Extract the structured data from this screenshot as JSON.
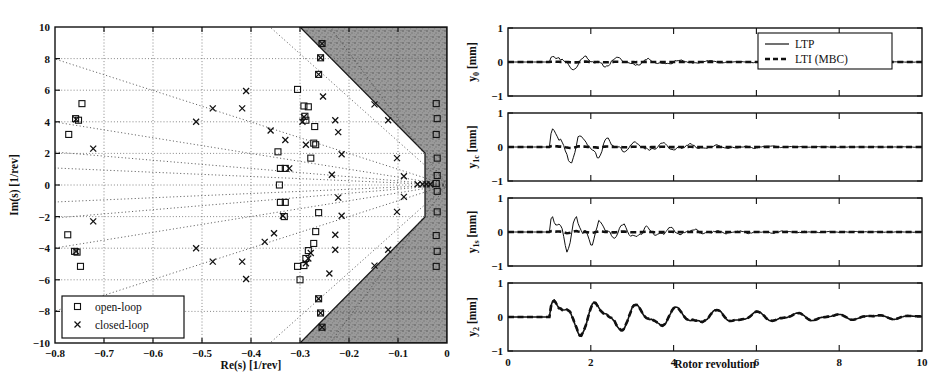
{
  "figure": {
    "caption_line1": "Figure 2: Pole map ... and closed-loop ...",
    "caption_visible": ""
  },
  "left_plot": {
    "name": "pole-map",
    "xlabel": "Re(s) [1/rev]",
    "ylabel": "Im(s) [1/rev]",
    "xticks": [
      "-0.8",
      "-0.7",
      "-0.6",
      "-0.5",
      "-0.4",
      "-0.3",
      "-0.2",
      "-0.1",
      "0"
    ],
    "xtick_values": [
      -0.8,
      -0.7,
      -0.6,
      -0.5,
      -0.4,
      -0.3,
      -0.2,
      -0.1,
      0
    ],
    "yticks": [
      "10",
      "8",
      "6",
      "4",
      "2",
      "0",
      "-2",
      "-4",
      "-6",
      "-8",
      "-10"
    ],
    "ytick_values": [
      10,
      8,
      6,
      4,
      2,
      0,
      -2,
      -4,
      -6,
      -8,
      -10
    ],
    "xlim": [
      -0.8,
      0
    ],
    "ylim": [
      -10,
      10
    ],
    "grid": true,
    "legend": [
      {
        "label": "open-loop",
        "marker": "square"
      },
      {
        "label": "closed-loop",
        "marker": "cross"
      }
    ],
    "shaded_region_label": "insufficient-damping-region",
    "shaded_color": "#8f8f8f"
  },
  "chart_data": [
    {
      "type": "scatter",
      "title": "Pole map",
      "xlabel": "Re(s) [1/rev]",
      "ylabel": "Im(s) [1/rev]",
      "xlim": [
        -0.8,
        0
      ],
      "ylim": [
        -10,
        10
      ],
      "grid": true,
      "legend_position": "lower-left",
      "series": [
        {
          "name": "open-loop",
          "marker": "square",
          "points": [
            [
              -0.745,
              5.15
            ],
            [
              -0.758,
              4.2
            ],
            [
              -0.752,
              4.1
            ],
            [
              -0.772,
              3.2
            ],
            [
              -0.774,
              -3.15
            ],
            [
              -0.76,
              -4.2
            ],
            [
              -0.755,
              -4.25
            ],
            [
              -0.748,
              -5.15
            ],
            [
              -0.345,
              2.1
            ],
            [
              -0.34,
              1.05
            ],
            [
              -0.33,
              1.05
            ],
            [
              -0.342,
              0.0
            ],
            [
              -0.34,
              -1.1
            ],
            [
              -0.33,
              -1.1
            ],
            [
              -0.332,
              -2.0
            ],
            [
              -0.305,
              6.05
            ],
            [
              -0.292,
              5.0
            ],
            [
              -0.283,
              4.95
            ],
            [
              -0.29,
              4.35
            ],
            [
              -0.288,
              4.1
            ],
            [
              -0.27,
              3.7
            ],
            [
              -0.272,
              2.65
            ],
            [
              -0.268,
              2.55
            ],
            [
              -0.278,
              1.7
            ],
            [
              -0.262,
              -1.75
            ],
            [
              -0.268,
              -2.95
            ],
            [
              -0.272,
              -3.7
            ],
            [
              -0.283,
              -4.15
            ],
            [
              -0.288,
              -4.65
            ],
            [
              -0.292,
              -5.1
            ],
            [
              -0.305,
              -5.15
            ],
            [
              -0.3,
              -6.0
            ],
            [
              -0.262,
              -7.2
            ],
            [
              -0.258,
              -8.1
            ],
            [
              -0.255,
              -9.0
            ],
            [
              -0.255,
              8.95
            ],
            [
              -0.258,
              8.05
            ],
            [
              -0.262,
              7.0
            ],
            [
              -0.022,
              5.15
            ],
            [
              -0.02,
              4.2
            ],
            [
              -0.022,
              3.2
            ],
            [
              -0.02,
              1.7
            ],
            [
              -0.02,
              0.6
            ],
            [
              -0.022,
              0.1
            ],
            [
              -0.02,
              -0.4
            ],
            [
              -0.02,
              -1.7
            ],
            [
              -0.022,
              -3.2
            ],
            [
              -0.02,
              -4.2
            ],
            [
              -0.022,
              -5.15
            ]
          ]
        },
        {
          "name": "closed-loop",
          "marker": "cross",
          "points": [
            [
              -0.757,
              4.15
            ],
            [
              -0.722,
              2.3
            ],
            [
              -0.757,
              -4.2
            ],
            [
              -0.722,
              -2.3
            ],
            [
              -0.478,
              4.85
            ],
            [
              -0.418,
              4.85
            ],
            [
              -0.41,
              5.95
            ],
            [
              -0.512,
              4.0
            ],
            [
              -0.512,
              -4.0
            ],
            [
              -0.478,
              -4.85
            ],
            [
              -0.418,
              -4.85
            ],
            [
              -0.41,
              -5.95
            ],
            [
              -0.36,
              3.45
            ],
            [
              -0.33,
              2.85
            ],
            [
              -0.322,
              1.05
            ],
            [
              -0.335,
              -1.95
            ],
            [
              -0.353,
              -3.05
            ],
            [
              -0.372,
              -3.6
            ],
            [
              -0.292,
              4.3
            ],
            [
              -0.295,
              4.0
            ],
            [
              -0.288,
              2.55
            ],
            [
              -0.278,
              -4.3
            ],
            [
              -0.283,
              -4.65
            ],
            [
              -0.288,
              -4.95
            ],
            [
              -0.253,
              5.6
            ],
            [
              -0.228,
              4.1
            ],
            [
              -0.222,
              3.35
            ],
            [
              -0.215,
              1.95
            ],
            [
              -0.235,
              0.65
            ],
            [
              -0.222,
              -0.8
            ],
            [
              -0.215,
              -1.95
            ],
            [
              -0.228,
              -3.15
            ],
            [
              -0.228,
              -4.1
            ],
            [
              -0.24,
              -5.6
            ],
            [
              -0.262,
              -7.2
            ],
            [
              -0.258,
              -8.1
            ],
            [
              -0.255,
              -9.0
            ],
            [
              -0.255,
              8.95
            ],
            [
              -0.258,
              8.05
            ],
            [
              -0.262,
              7.0
            ],
            [
              -0.148,
              5.1
            ],
            [
              -0.12,
              4.1
            ],
            [
              -0.102,
              1.7
            ],
            [
              -0.088,
              0.55
            ],
            [
              -0.088,
              -0.75
            ],
            [
              -0.102,
              -1.7
            ],
            [
              -0.12,
              -4.1
            ],
            [
              -0.148,
              -5.1
            ],
            [
              -0.06,
              0.05
            ],
            [
              -0.05,
              0.05
            ],
            [
              -0.042,
              0.05
            ],
            [
              -0.034,
              0.05
            ]
          ]
        }
      ]
    },
    {
      "type": "line",
      "title": "y_0 response",
      "xlabel": "",
      "ylabel": "y_0 [mm]",
      "xlim": [
        0,
        10
      ],
      "ylim": [
        -1,
        1
      ],
      "xticks": [
        0,
        2,
        4,
        6,
        8,
        10
      ],
      "yticks": [
        -1,
        0,
        1
      ],
      "series": [
        {
          "name": "LTP",
          "style": "solid"
        },
        {
          "name": "LTI (MBC)",
          "style": "dashed"
        }
      ]
    },
    {
      "type": "line",
      "title": "y_1c response",
      "xlabel": "",
      "ylabel": "y_1c [mm]",
      "xlim": [
        0,
        10
      ],
      "ylim": [
        -1,
        1
      ],
      "xticks": [
        0,
        2,
        4,
        6,
        8,
        10
      ],
      "yticks": [
        -1,
        0,
        1
      ],
      "series": [
        {
          "name": "LTP",
          "style": "solid"
        },
        {
          "name": "LTI (MBC)",
          "style": "dashed"
        }
      ]
    },
    {
      "type": "line",
      "title": "y_1s response",
      "xlabel": "",
      "ylabel": "y_1s [mm]",
      "xlim": [
        0,
        10
      ],
      "ylim": [
        -1,
        1
      ],
      "xticks": [
        0,
        2,
        4,
        6,
        8,
        10
      ],
      "yticks": [
        -1,
        0,
        1
      ],
      "series": [
        {
          "name": "LTP",
          "style": "solid"
        },
        {
          "name": "LTI (MBC)",
          "style": "dashed"
        }
      ]
    },
    {
      "type": "line",
      "title": "y_2 response",
      "xlabel": "Rotor revolution",
      "ylabel": "y_2 [mm]",
      "xlim": [
        0,
        10
      ],
      "ylim": [
        -1,
        1
      ],
      "xticks": [
        0,
        2,
        4,
        6,
        8,
        10
      ],
      "yticks": [
        -1,
        0,
        1
      ],
      "series": [
        {
          "name": "LTP",
          "style": "solid"
        },
        {
          "name": "LTI (MBC)",
          "style": "dashed"
        }
      ]
    }
  ],
  "right_plots": {
    "xlabel": "Rotor revolution",
    "xticks": [
      "0",
      "2",
      "4",
      "6",
      "8",
      "10"
    ],
    "yticks": [
      "1",
      "0",
      "-1"
    ],
    "legend": [
      {
        "label": "LTP",
        "style": "solid"
      },
      {
        "label": "LTI (MBC)",
        "style": "dashed"
      }
    ],
    "panels": [
      {
        "id": "y0",
        "ylabel_base": "y",
        "ylabel_sub": "0",
        "ylabel_unit": " [mm]"
      },
      {
        "id": "y1c",
        "ylabel_base": "y",
        "ylabel_sub": "1c",
        "ylabel_unit": " [mm]"
      },
      {
        "id": "y1s",
        "ylabel_base": "y",
        "ylabel_sub": "1s",
        "ylabel_unit": " [mm]"
      },
      {
        "id": "y2",
        "ylabel_base": "y",
        "ylabel_sub": "2",
        "ylabel_unit": " [mm]"
      }
    ]
  }
}
